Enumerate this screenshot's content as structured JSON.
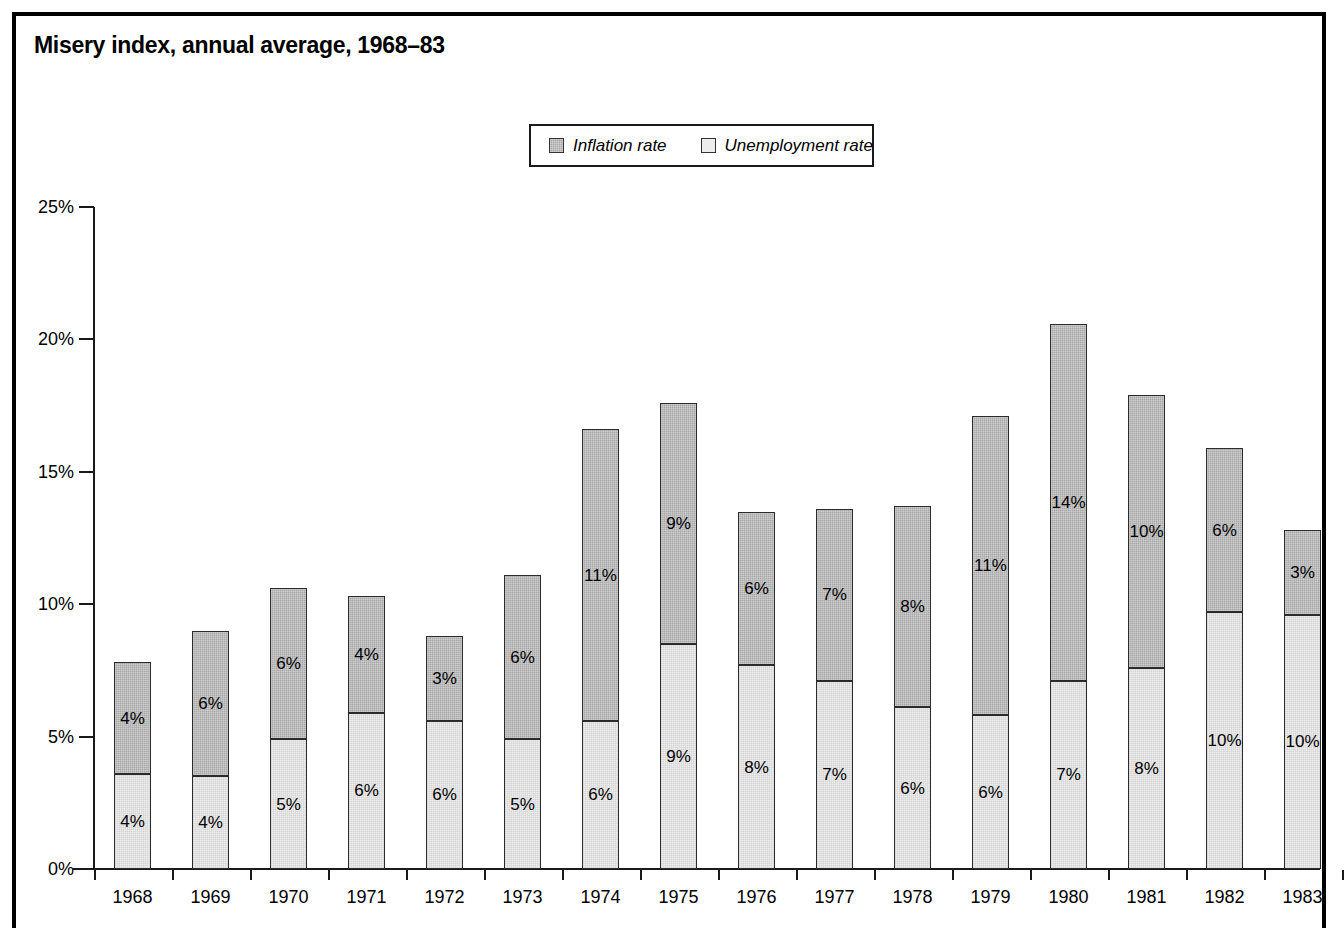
{
  "figure": {
    "title": "Misery index, annual average, 1968–83"
  },
  "legend": {
    "position": "top-center",
    "items": [
      {
        "label": "Inflation rate",
        "color": "#a9a9a9",
        "swatch": "inflation-swatch"
      },
      {
        "label": "Unemployment rate",
        "color": "#ededed",
        "swatch": "unemployment-swatch"
      }
    ]
  },
  "axes": {
    "y_ticks": [
      "0%",
      "5%",
      "10%",
      "15%",
      "20%",
      "25%"
    ],
    "y_tick_values": [
      0,
      5,
      10,
      15,
      20,
      25
    ],
    "x_ticks": [
      "1968",
      "1969",
      "1970",
      "1971",
      "1972",
      "1973",
      "1974",
      "1975",
      "1976",
      "1977",
      "1978",
      "1979",
      "1980",
      "1981",
      "1982",
      "1983"
    ]
  },
  "chart_data": {
    "type": "bar",
    "stacked": true,
    "title": "Misery index, annual average, 1968–83",
    "xlabel": "",
    "ylabel": "",
    "ylim": [
      0,
      25
    ],
    "grid": false,
    "legend_position": "top-center",
    "categories": [
      "1968",
      "1969",
      "1970",
      "1971",
      "1972",
      "1973",
      "1974",
      "1975",
      "1976",
      "1977",
      "1978",
      "1979",
      "1980",
      "1981",
      "1982",
      "1983"
    ],
    "series": [
      {
        "name": "Unemployment rate",
        "color": "#ededed",
        "values": [
          3.6,
          3.5,
          4.9,
          5.9,
          5.6,
          4.9,
          5.6,
          8.5,
          7.7,
          7.1,
          6.1,
          5.8,
          7.1,
          7.6,
          9.7,
          9.6
        ],
        "labels": [
          "4%",
          "4%",
          "5%",
          "6%",
          "6%",
          "5%",
          "6%",
          "9%",
          "8%",
          "7%",
          "6%",
          "6%",
          "7%",
          "8%",
          "10%",
          "10%"
        ]
      },
      {
        "name": "Inflation rate",
        "color": "#a9a9a9",
        "values": [
          4.2,
          5.5,
          5.7,
          4.4,
          3.2,
          6.2,
          11.0,
          9.1,
          5.8,
          6.5,
          7.6,
          11.3,
          13.5,
          10.3,
          6.2,
          3.2
        ],
        "labels": [
          "4%",
          "6%",
          "6%",
          "4%",
          "3%",
          "6%",
          "11%",
          "9%",
          "6%",
          "7%",
          "8%",
          "11%",
          "14%",
          "10%",
          "6%",
          "3%"
        ]
      }
    ],
    "totals": [
      7.8,
      9.0,
      10.6,
      10.3,
      8.8,
      11.1,
      16.6,
      17.6,
      13.5,
      13.6,
      13.7,
      17.1,
      20.6,
      17.9,
      15.9,
      12.8
    ]
  }
}
